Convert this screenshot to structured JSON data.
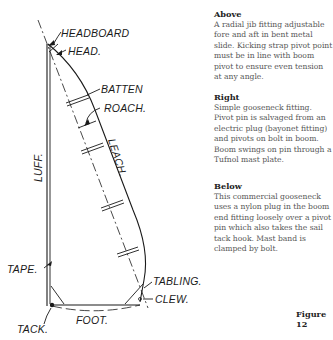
{
  "diagram": {
    "labels": {
      "headboard": "HEADBOARD",
      "head": "HEAD.",
      "batten": "BATTEN",
      "roach": "ROACH.",
      "leach": "LEACH.",
      "luff": "LUFF.",
      "tape": "TAPE.",
      "tabling": "TABLING.",
      "clew": "CLEW.",
      "foot": "FOOT.",
      "tack": "TACK."
    }
  },
  "captions": [
    {
      "heading": "Above",
      "text": "A radial jib fitting adjustable fore and aft in bent metal slide. Kicking strap pivot point must be in line with boom pivot to ensure even tension at any angle."
    },
    {
      "heading": "Right",
      "text": "Simple gooseneck fitting. Pivot pin is salvaged from an electric plug (bayonet fitting) and pivots on bolt in boom. Boom swings on pin through a Tufnol mast plate."
    },
    {
      "heading": "Below",
      "text": "This commercial gooseneck uses a nylon plug in the boom end fitting loosely over a pivot pin which also takes the sail tack hook. Mast band is clamped by bolt."
    }
  ],
  "figure": {
    "title": "Figure 12"
  }
}
